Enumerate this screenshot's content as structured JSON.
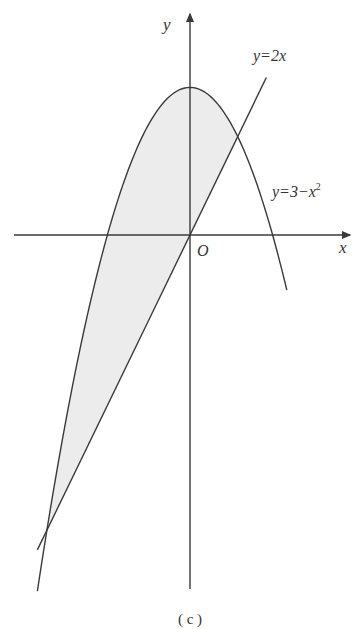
{
  "figure": {
    "caption": "( c )",
    "axes": {
      "x_label": "x",
      "y_label": "y",
      "origin_label": "O"
    },
    "curves": [
      {
        "name": "line",
        "label": "y=2x",
        "equation": "y = 2x",
        "x_range": [
          -3.2,
          1.6
        ]
      },
      {
        "name": "parabola",
        "label_main": "y=3−x",
        "label_exp": "2",
        "equation": "y = 3 - x^2",
        "x_range": [
          -3.2,
          2.03
        ]
      }
    ],
    "shaded_region": {
      "description": "Region between y=3-x^2 (above) and y=2x (below)",
      "x_from": -3,
      "x_to": 1,
      "fill": "#ececec"
    },
    "intersections": [
      {
        "x": -3,
        "y": -6
      },
      {
        "x": 1,
        "y": 2
      }
    ],
    "colors": {
      "stroke": "#3a3a3a",
      "shade": "#ececec",
      "text": "#333333"
    }
  }
}
